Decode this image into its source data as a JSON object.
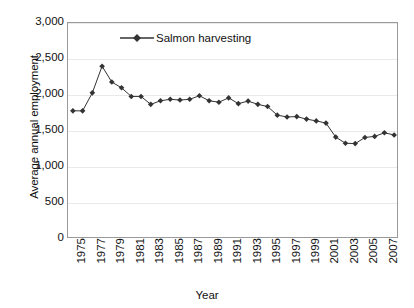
{
  "chart_data": {
    "type": "line",
    "title": "",
    "subtitle": "",
    "xlabel": "Year",
    "ylabel": "Average annual employment",
    "legend_position": "inside-top-center",
    "grid": true,
    "ylim": [
      0,
      3000
    ],
    "yticks": [
      0,
      500,
      1000,
      1500,
      2000,
      2500,
      3000
    ],
    "ytick_labels": [
      "0",
      "500",
      "1,000",
      "1,500",
      "2,000",
      "2,500",
      "3,000"
    ],
    "xlim": [
      1975,
      2008
    ],
    "xtick_labels": [
      "1975",
      "1977",
      "1979",
      "1981",
      "1983",
      "1985",
      "1987",
      "1989",
      "1991",
      "1993",
      "1995",
      "1997",
      "1999",
      "2001",
      "2003",
      "2005",
      "2007"
    ],
    "x": [
      1975,
      1976,
      1977,
      1978,
      1979,
      1980,
      1981,
      1982,
      1983,
      1984,
      1985,
      1986,
      1987,
      1988,
      1989,
      1990,
      1991,
      1992,
      1993,
      1994,
      1995,
      1996,
      1997,
      1998,
      1999,
      2000,
      2001,
      2002,
      2003,
      2004,
      2005,
      2006,
      2007,
      2008
    ],
    "series": [
      {
        "name": "Salmon harvesting",
        "color": "#333333",
        "marker": "diamond",
        "values": [
          1780,
          1780,
          2030,
          2400,
          2180,
          2100,
          1980,
          1980,
          1870,
          1920,
          1940,
          1930,
          1940,
          1990,
          1920,
          1900,
          1960,
          1880,
          1915,
          1870,
          1840,
          1720,
          1695,
          1700,
          1665,
          1640,
          1610,
          1415,
          1330,
          1325,
          1410,
          1425,
          1475,
          1445
        ]
      }
    ]
  },
  "legend": {
    "entries": [
      {
        "label": "Salmon harvesting"
      }
    ]
  },
  "axes": {
    "y_title": "Average annual employment",
    "x_title": "Year"
  }
}
